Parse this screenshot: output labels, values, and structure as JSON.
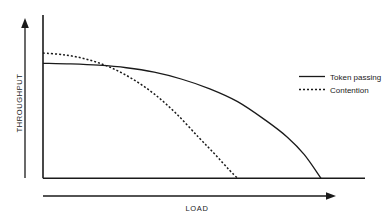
{
  "chart_data": {
    "type": "line",
    "title": "",
    "subtitle": "",
    "xlabel": "LOAD",
    "ylabel": "THROUGHPUT",
    "grid": false,
    "axis_style": "arrow-axes-unlabeled",
    "xlim": [
      0,
      1
    ],
    "ylim": [
      0,
      1
    ],
    "xticks": [],
    "yticks": [],
    "legend_position": "right",
    "annotations": [],
    "series": [
      {
        "name": "Token passing",
        "style": "solid",
        "color": "#1a1a1a",
        "x": [
          0.0,
          0.1,
          0.2,
          0.3,
          0.4,
          0.5,
          0.6,
          0.7,
          0.8,
          0.88,
          0.94,
          1.0
        ],
        "y": [
          0.9,
          0.895,
          0.885,
          0.865,
          0.83,
          0.775,
          0.7,
          0.6,
          0.455,
          0.32,
          0.185,
          0.0
        ]
      },
      {
        "name": "Contention",
        "style": "dotted",
        "color": "#1a1a1a",
        "x": [
          0.0,
          0.08,
          0.16,
          0.24,
          0.32,
          0.4,
          0.48,
          0.56,
          0.62,
          0.67,
          0.7
        ],
        "y": [
          0.98,
          0.965,
          0.93,
          0.87,
          0.78,
          0.66,
          0.505,
          0.32,
          0.185,
          0.065,
          0.0
        ]
      }
    ]
  },
  "legend": {
    "entries": [
      {
        "label": "Token passing",
        "style": "solid"
      },
      {
        "label": "Contention",
        "style": "dotted"
      }
    ]
  },
  "axes": {
    "y_axis_label": "THROUGHPUT",
    "x_axis_label": "LOAD"
  }
}
